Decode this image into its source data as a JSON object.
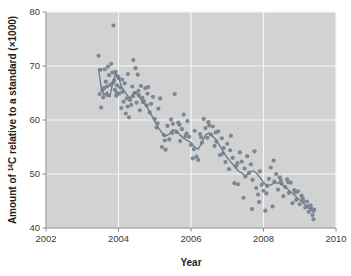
{
  "chart_data": {
    "type": "scatter",
    "title": "",
    "xlabel": "Year",
    "ylabel": "Amount of ¹⁴C relative to a standard (×1000)",
    "ylabel_parts": {
      "prefix": "Amount of ",
      "superscript": "14",
      "suffix": "C relative to a standard (×1000)"
    },
    "xlim": [
      2002,
      2010
    ],
    "ylim": [
      40,
      80
    ],
    "xticks": [
      "2002",
      "2004",
      "2006",
      "2008",
      "2010"
    ],
    "yticks": [
      "40",
      "50",
      "60",
      "70",
      "80"
    ],
    "grid": true,
    "legend": "none",
    "plot_bg": "#d2d2d2",
    "grid_color": "#f5f5f5",
    "point_color": "#7b8794",
    "line_color": "#6f7b88",
    "axis_color": "#8a8a8a",
    "point_size": 2.1,
    "series": [
      {
        "name": "14C measurements",
        "x": [
          2003.45,
          2003.48,
          2003.52,
          2003.55,
          2003.58,
          2003.62,
          2003.65,
          2003.68,
          2003.71,
          2003.74,
          2003.77,
          2003.8,
          2003.83,
          2003.86,
          2003.88,
          2003.9,
          2003.92,
          2003.94,
          2003.96,
          2003.98,
          2004.0,
          2004.02,
          2004.05,
          2004.08,
          2004.11,
          2004.14,
          2004.17,
          2004.2,
          2004.23,
          2004.26,
          2004.29,
          2004.32,
          2004.35,
          2004.38,
          2004.41,
          2004.44,
          2004.47,
          2004.5,
          2004.53,
          2004.56,
          2004.59,
          2004.62,
          2004.66,
          2004.7,
          2004.74,
          2004.78,
          2004.82,
          2004.86,
          2004.9,
          2004.95,
          2005.0,
          2005.05,
          2005.1,
          2005.15,
          2005.2,
          2005.25,
          2005.3,
          2005.35,
          2005.4,
          2005.45,
          2005.5,
          2005.55,
          2005.6,
          2005.65,
          2005.7,
          2005.75,
          2005.8,
          2005.85,
          2005.9,
          2005.95,
          2006.0,
          2006.05,
          2006.1,
          2006.15,
          2006.2,
          2006.25,
          2006.3,
          2006.35,
          2006.4,
          2006.45,
          2006.5,
          2006.55,
          2006.6,
          2006.65,
          2006.7,
          2006.75,
          2006.8,
          2006.85,
          2006.9,
          2006.95,
          2007.0,
          2007.05,
          2007.1,
          2007.15,
          2007.2,
          2007.25,
          2007.3,
          2007.35,
          2007.4,
          2007.45,
          2007.5,
          2007.55,
          2007.6,
          2007.65,
          2007.7,
          2007.75,
          2007.8,
          2007.85,
          2007.9,
          2007.95,
          2008.0,
          2008.05,
          2008.1,
          2008.15,
          2008.2,
          2008.25,
          2008.3,
          2008.35,
          2008.4,
          2008.45,
          2008.5,
          2008.55,
          2008.6,
          2008.65,
          2008.7,
          2008.75,
          2008.8,
          2008.85,
          2008.9,
          2008.95,
          2009.0,
          2009.05,
          2009.1,
          2009.15,
          2009.2,
          2009.25,
          2009.3,
          2009.35,
          2009.38,
          2009.4,
          2003.5,
          2003.6,
          2003.7,
          2003.85,
          2003.95,
          2004.1,
          2004.25,
          2004.4,
          2004.55,
          2004.68,
          2004.8,
          2005.08,
          2005.28,
          2005.48,
          2005.68,
          2005.88,
          2006.08,
          2006.28,
          2006.48,
          2006.68,
          2006.88,
          2007.08,
          2007.28,
          2007.48,
          2007.68,
          2007.88,
          2008.08,
          2008.28,
          2008.48,
          2008.68,
          2008.88,
          2009.08,
          2009.22,
          2009.32
        ],
        "y": [
          71.9,
          64.8,
          62.3,
          65.5,
          64.2,
          69.4,
          67.1,
          66.2,
          69.9,
          68.3,
          66.5,
          70.4,
          68.8,
          77.5,
          67.3,
          65.6,
          68.9,
          64.5,
          66.4,
          68.1,
          67.8,
          64.9,
          66.0,
          62.2,
          65.2,
          63.4,
          66.8,
          61.2,
          64.0,
          68.5,
          60.5,
          63.7,
          62.8,
          66.2,
          71.1,
          65.0,
          69.6,
          63.2,
          68.4,
          64.6,
          61.8,
          66.3,
          64.1,
          63.5,
          65.9,
          62.7,
          66.1,
          61.4,
          63.0,
          64.3,
          60.2,
          58.6,
          62.1,
          64.0,
          55.0,
          57.2,
          54.5,
          58.9,
          56.4,
          60.1,
          59.3,
          64.8,
          57.8,
          59.5,
          56.1,
          58.3,
          61.0,
          57.0,
          59.8,
          56.9,
          55.4,
          52.9,
          58.0,
          53.2,
          52.6,
          57.4,
          55.8,
          60.2,
          58.5,
          56.7,
          59.0,
          57.3,
          58.8,
          55.2,
          56.0,
          57.9,
          53.5,
          56.6,
          54.8,
          52.2,
          55.6,
          50.9,
          57.1,
          53.0,
          48.3,
          51.5,
          48.1,
          54.0,
          52.3,
          45.6,
          49.5,
          53.3,
          50.2,
          51.8,
          48.9,
          54.2,
          47.4,
          46.2,
          50.5,
          48.0,
          46.9,
          43.2,
          47.8,
          49.1,
          51.2,
          44.0,
          48.6,
          50.0,
          47.1,
          49.4,
          48.2,
          45.9,
          47.6,
          49.0,
          46.5,
          48.4,
          44.6,
          47.0,
          45.2,
          46.8,
          44.4,
          46.0,
          45.0,
          43.8,
          44.9,
          43.0,
          44.2,
          42.4,
          41.6,
          43.4,
          69.3,
          65.9,
          64.6,
          66.9,
          65.1,
          67.5,
          62.5,
          64.4,
          65.4,
          63.3,
          64.9,
          59.4,
          56.2,
          57.6,
          59.1,
          57.5,
          54.6,
          56.8,
          59.6,
          57.7,
          53.8,
          54.4,
          52.0,
          51.0,
          43.5,
          44.8,
          46.4,
          52.5,
          48.8,
          48.5,
          46.6,
          45.5,
          44.0,
          43.6
        ]
      }
    ],
    "trend_line": {
      "name": "smoothed trend",
      "x": [
        2003.45,
        2003.52,
        2003.6,
        2003.68,
        2003.76,
        2003.84,
        2003.92,
        2004.0,
        2004.08,
        2004.16,
        2004.24,
        2004.32,
        2004.4,
        2004.48,
        2004.56,
        2004.64,
        2004.72,
        2004.8,
        2004.9,
        2005.0,
        2005.1,
        2005.2,
        2005.3,
        2005.4,
        2005.5,
        2005.6,
        2005.7,
        2005.8,
        2005.9,
        2006.0,
        2006.1,
        2006.2,
        2006.3,
        2006.4,
        2006.5,
        2006.6,
        2006.7,
        2006.8,
        2006.9,
        2007.0,
        2007.1,
        2007.2,
        2007.3,
        2007.4,
        2007.5,
        2007.6,
        2007.7,
        2007.8,
        2007.9,
        2008.0,
        2008.1,
        2008.2,
        2008.3,
        2008.4,
        2008.5,
        2008.6,
        2008.7,
        2008.8,
        2008.9,
        2009.0,
        2009.1,
        2009.2,
        2009.3,
        2009.4
      ],
      "y": [
        69.4,
        66.2,
        64.6,
        65.2,
        64.3,
        66.8,
        68.6,
        67.9,
        66.2,
        65.4,
        64.6,
        64.0,
        64.8,
        65.2,
        64.4,
        63.6,
        63.0,
        62.2,
        61.0,
        59.8,
        58.6,
        57.6,
        57.0,
        57.4,
        58.2,
        58.0,
        57.2,
        56.6,
        56.2,
        55.8,
        55.0,
        54.6,
        55.8,
        57.2,
        57.6,
        57.0,
        56.2,
        55.2,
        54.0,
        53.0,
        52.2,
        51.4,
        50.6,
        50.2,
        49.6,
        50.2,
        50.6,
        50.2,
        49.4,
        48.4,
        47.8,
        48.0,
        48.3,
        48.4,
        48.1,
        47.6,
        47.0,
        46.4,
        45.8,
        45.2,
        44.6,
        44.0,
        43.4,
        42.9
      ]
    }
  }
}
